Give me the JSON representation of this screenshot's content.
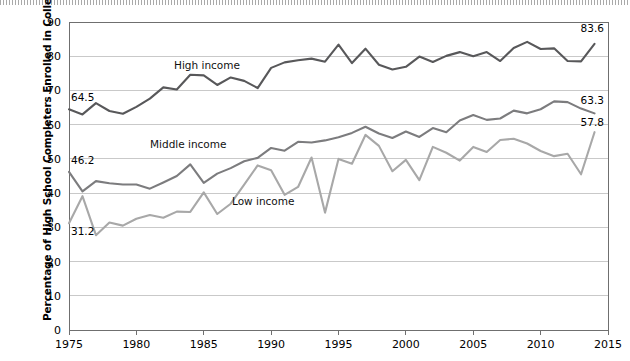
{
  "chart_data": {
    "type": "line",
    "title": "",
    "xlabel": "",
    "ylabel": "Percentage of High School Completers Enrolled in College",
    "xlim": [
      1975,
      2015
    ],
    "ylim": [
      0,
      90
    ],
    "ytick_step": 10,
    "xtick_step": 5,
    "grid": true,
    "legend_position": "inline-annotations",
    "yticks": [
      "0",
      "10",
      "20",
      "30",
      "40",
      "50",
      "60",
      "70",
      "80",
      "90"
    ],
    "xticks": [
      "1975",
      "1980",
      "1985",
      "1990",
      "1995",
      "2000",
      "2005",
      "2010",
      "2015"
    ],
    "x": [
      1975,
      1976,
      1977,
      1978,
      1979,
      1980,
      1981,
      1982,
      1983,
      1984,
      1985,
      1986,
      1987,
      1988,
      1989,
      1990,
      1991,
      1992,
      1993,
      1994,
      1995,
      1996,
      1997,
      1998,
      1999,
      2000,
      2001,
      2002,
      2003,
      2004,
      2005,
      2006,
      2007,
      2008,
      2009,
      2010,
      2011,
      2012,
      2013,
      2014
    ],
    "series": [
      {
        "name": "High income",
        "color": "#58585a",
        "label_color": "#111111",
        "start_value": 64.5,
        "end_value": 83.6,
        "values": [
          64.5,
          63.0,
          66.3,
          64.0,
          63.2,
          65.2,
          67.6,
          70.9,
          70.3,
          74.6,
          74.4,
          71.6,
          73.8,
          72.8,
          70.7,
          76.6,
          78.2,
          78.8,
          79.3,
          78.4,
          83.4,
          78.0,
          82.2,
          77.5,
          76.1,
          76.9,
          79.9,
          78.3,
          80.1,
          81.2,
          80.0,
          81.2,
          78.6,
          82.4,
          84.2,
          82.1,
          82.3,
          78.6,
          78.5,
          83.6
        ]
      },
      {
        "name": "Middle income",
        "color": "#7c7c7e",
        "label_color": "#111111",
        "start_value": 46.2,
        "end_value": 63.3,
        "values": [
          46.2,
          40.5,
          43.5,
          42.9,
          42.5,
          42.5,
          41.3,
          43.1,
          45.0,
          48.4,
          43.0,
          45.7,
          47.3,
          49.3,
          50.3,
          53.2,
          52.4,
          55.0,
          54.8,
          55.4,
          56.3,
          57.6,
          59.4,
          57.4,
          56.1,
          58.0,
          56.4,
          59.0,
          57.8,
          61.2,
          62.8,
          61.4,
          61.8,
          64.1,
          63.3,
          64.5,
          66.8,
          66.6,
          64.7,
          63.3
        ]
      },
      {
        "name": "Low income",
        "color": "#a8a8a8",
        "label_color": "#111111",
        "start_value": 31.2,
        "end_value": 57.8,
        "values": [
          31.2,
          39.1,
          27.7,
          31.4,
          30.5,
          32.5,
          33.6,
          32.8,
          34.6,
          34.5,
          40.2,
          33.9,
          36.9,
          42.5,
          48.1,
          46.7,
          39.5,
          41.8,
          50.4,
          34.3,
          50.0,
          48.6,
          57.0,
          53.8,
          46.4,
          49.7,
          43.8,
          53.5,
          51.8,
          49.5,
          53.5,
          52.0,
          55.5,
          55.9,
          54.5,
          52.3,
          50.8,
          51.5,
          45.5,
          57.8
        ]
      }
    ]
  },
  "annotations": {
    "start_labels": [
      {
        "text": "64.5",
        "series": "High income"
      },
      {
        "text": "46.2",
        "series": "Middle income"
      },
      {
        "text": "31.2",
        "series": "Low income"
      }
    ],
    "end_labels": [
      {
        "text": "83.6",
        "series": "High income"
      },
      {
        "text": "63.3",
        "series": "Middle income"
      },
      {
        "text": "57.8",
        "series": "Low income"
      }
    ],
    "series_names": [
      {
        "text": "High income"
      },
      {
        "text": "Middle income"
      },
      {
        "text": "Low income"
      }
    ]
  },
  "axis": {
    "y_title": "Percentage of High School Completers Enrolled in College"
  },
  "colors": {
    "high_income": "#58585a",
    "middle_income": "#7c7c7e",
    "low_income": "#a8a8a8",
    "grid": "#c9c9c9",
    "axis": "#6f6f6f",
    "background": "#ffffff"
  }
}
